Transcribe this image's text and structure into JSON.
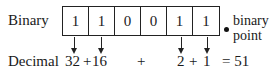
{
  "labels": {
    "binary": "Binary",
    "decimal": "Decimal"
  },
  "bits": [
    "1",
    "1",
    "0",
    "0",
    "1",
    "1"
  ],
  "binary_point": {
    "line1": "binary",
    "line2": "point"
  },
  "sum": {
    "term1": "32",
    "plus1": "+",
    "term2": "16",
    "plus2": "+",
    "term3": "2",
    "plus3": "+",
    "term4": "1",
    "equals": "= 51"
  }
}
